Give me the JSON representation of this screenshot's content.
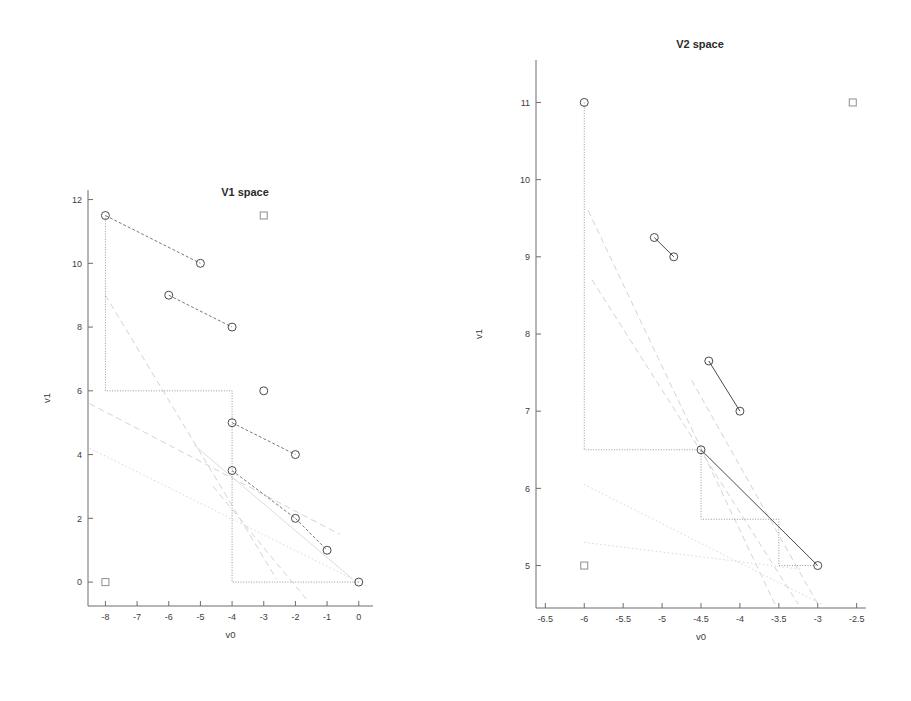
{
  "figure": {
    "background": "#ffffff",
    "width": 911,
    "height": 701
  },
  "panels": [
    {
      "id": "v1-space",
      "title": "V1 space",
      "xlabel": "v0",
      "ylabel": "v1"
    },
    {
      "id": "v2-space",
      "title": "V2 space",
      "xlabel": "v0",
      "ylabel": "v1"
    }
  ],
  "chart_data": [
    {
      "type": "scatter",
      "id": "v1-space",
      "title": "V1 space",
      "xlabel": "v0",
      "ylabel": "v1",
      "xlim": [
        -8.55,
        0.45
      ],
      "ylim": [
        -0.75,
        12.3
      ],
      "xticks": [
        -8,
        -7,
        -6,
        -5,
        -4,
        -3,
        -2,
        -1,
        0
      ],
      "xticklabels": [
        "-8",
        "-7",
        "-6",
        "-5",
        "-4",
        "-3",
        "-2",
        "-1",
        "0"
      ],
      "yticks": [
        0,
        2,
        4,
        6,
        8,
        10,
        12
      ],
      "yticklabels": [
        "0",
        "2",
        "4",
        "6",
        "8",
        "10",
        "12"
      ],
      "grid": false,
      "legend": "none",
      "marker_shape": "open-circle",
      "points_circle": [
        {
          "x": -8,
          "y": 11.5
        },
        {
          "x": -5,
          "y": 10
        },
        {
          "x": -6,
          "y": 9
        },
        {
          "x": -4,
          "y": 8
        },
        {
          "x": -3,
          "y": 6
        },
        {
          "x": -4,
          "y": 5
        },
        {
          "x": -2,
          "y": 4
        },
        {
          "x": -4,
          "y": 3.5
        },
        {
          "x": -2,
          "y": 2
        },
        {
          "x": -1,
          "y": 1
        },
        {
          "x": 0,
          "y": 0
        }
      ],
      "points_square": [
        {
          "x": -3,
          "y": 11.5
        },
        {
          "x": -8,
          "y": 0
        }
      ],
      "segments": [
        {
          "style": "dashed",
          "from": {
            "x": -8,
            "y": 11.5
          },
          "to": {
            "x": -5,
            "y": 10
          }
        },
        {
          "style": "dashed",
          "from": {
            "x": -6,
            "y": 9
          },
          "to": {
            "x": -4,
            "y": 8
          }
        },
        {
          "style": "dashed",
          "from": {
            "x": -4,
            "y": 5
          },
          "to": {
            "x": -2,
            "y": 4
          }
        },
        {
          "style": "dashed",
          "from": {
            "x": -4,
            "y": 3.5
          },
          "to": {
            "x": -2,
            "y": 2
          }
        },
        {
          "style": "dashed",
          "from": {
            "x": -2,
            "y": 2
          },
          "to": {
            "x": -1,
            "y": 1
          }
        }
      ],
      "staircase": {
        "style": "dotted",
        "vertices": [
          {
            "x": -8,
            "y": 11.5
          },
          {
            "x": -8,
            "y": 6
          },
          {
            "x": -4,
            "y": 6
          },
          {
            "x": -4,
            "y": 0
          },
          {
            "x": 0,
            "y": 0
          }
        ]
      },
      "faint_lines": [
        {
          "style": "dashed",
          "from": {
            "x": -8,
            "y": 9
          },
          "to": {
            "x": -2.6,
            "y": 0.1
          }
        },
        {
          "style": "dashed",
          "from": {
            "x": -8.5,
            "y": 5.6
          },
          "to": {
            "x": -0.6,
            "y": 1.5
          }
        },
        {
          "style": "dotted",
          "from": {
            "x": -8.5,
            "y": 4.2
          },
          "to": {
            "x": 0.3,
            "y": -0.15
          }
        },
        {
          "style": "solid",
          "from": {
            "x": -5.2,
            "y": 4.3
          },
          "to": {
            "x": -0.2,
            "y": 0.1
          }
        },
        {
          "style": "dashed",
          "from": {
            "x": -4.6,
            "y": 3.0
          },
          "to": {
            "x": -1.6,
            "y": -0.6
          }
        }
      ]
    },
    {
      "type": "scatter",
      "id": "v2-space",
      "title": "V2 space",
      "xlabel": "v0",
      "ylabel": "v1",
      "xlim": [
        -6.62,
        -2.38
      ],
      "ylim": [
        4.45,
        11.55
      ],
      "xticks": [
        -6.5,
        -6,
        -5.5,
        -5,
        -4.5,
        -4,
        -3.5,
        -3,
        -2.5
      ],
      "xticklabels": [
        "-6.5",
        "-6",
        "-5.5",
        "-5",
        "-4.5",
        "-4",
        "-3.5",
        "-3",
        "-2.5"
      ],
      "yticks": [
        5,
        6,
        7,
        8,
        9,
        10,
        11
      ],
      "yticklabels": [
        "5",
        "6",
        "7",
        "8",
        "9",
        "10",
        "11"
      ],
      "grid": false,
      "legend": "none",
      "marker_shape": "open-circle",
      "points_circle": [
        {
          "x": -6,
          "y": 11
        },
        {
          "x": -5.1,
          "y": 9.25
        },
        {
          "x": -4.85,
          "y": 9
        },
        {
          "x": -4.4,
          "y": 7.65
        },
        {
          "x": -4,
          "y": 7
        },
        {
          "x": -4.5,
          "y": 6.5
        },
        {
          "x": -3,
          "y": 5
        }
      ],
      "points_square": [
        {
          "x": -2.55,
          "y": 11
        },
        {
          "x": -6,
          "y": 5
        }
      ],
      "segments": [
        {
          "style": "solid",
          "from": {
            "x": -5.1,
            "y": 9.25
          },
          "to": {
            "x": -4.85,
            "y": 9
          }
        },
        {
          "style": "solid",
          "from": {
            "x": -4.4,
            "y": 7.65
          },
          "to": {
            "x": -4,
            "y": 7
          }
        },
        {
          "style": "solid",
          "from": {
            "x": -4.5,
            "y": 6.5
          },
          "to": {
            "x": -3,
            "y": 5
          }
        }
      ],
      "staircase": {
        "style": "dotted",
        "vertices": [
          {
            "x": -6,
            "y": 11
          },
          {
            "x": -6,
            "y": 6.5
          },
          {
            "x": -4.5,
            "y": 6.5
          },
          {
            "x": -4.5,
            "y": 5.6
          },
          {
            "x": -3.5,
            "y": 5.6
          },
          {
            "x": -3.5,
            "y": 5
          },
          {
            "x": -3,
            "y": 5
          }
        ]
      },
      "faint_lines": [
        {
          "style": "dashed",
          "from": {
            "x": -5.95,
            "y": 9.6
          },
          "to": {
            "x": -3.55,
            "y": 4.5
          }
        },
        {
          "style": "dashed",
          "from": {
            "x": -5.9,
            "y": 8.7
          },
          "to": {
            "x": -3.25,
            "y": 4.5
          }
        },
        {
          "style": "dotted",
          "from": {
            "x": -6,
            "y": 6.05
          },
          "to": {
            "x": -2.95,
            "y": 4.5
          }
        },
        {
          "style": "dotted",
          "from": {
            "x": -6,
            "y": 5.3
          },
          "to": {
            "x": -3.2,
            "y": 4.95
          }
        },
        {
          "style": "dashed",
          "from": {
            "x": -4.62,
            "y": 7.4
          },
          "to": {
            "x": -3.0,
            "y": 4.5
          }
        }
      ]
    }
  ]
}
